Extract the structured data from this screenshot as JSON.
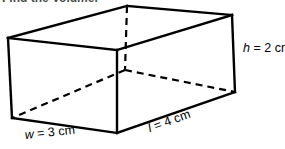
{
  "heading": {
    "text": "Find the Volume."
  },
  "figure": {
    "name": "rectangular-prism",
    "stroke_color": "#000000",
    "background_color": "#ffffff",
    "stroke_width": 2.2,
    "hidden_edge_style": "dashed",
    "vertices": {
      "top_left": [
        8,
        38
      ],
      "top_back": [
        127,
        6
      ],
      "top_right": [
        232,
        15
      ],
      "top_front": [
        117,
        50
      ],
      "bottom_left": [
        12,
        118
      ],
      "bottom_front": [
        117,
        133
      ],
      "bottom_right": [
        235,
        92
      ],
      "bottom_back_hidden": [
        125,
        70
      ]
    }
  },
  "labels": {
    "height": {
      "variable": "h",
      "equals": " = ",
      "value": "2 cm",
      "full": "h = 2 cm"
    },
    "width": {
      "variable": "w",
      "equals": " = ",
      "value": "3 cm",
      "full": "w = 3 cm"
    },
    "length": {
      "variable": "l",
      "equals": " = ",
      "value": "4 cm",
      "full": "l = 4 cm"
    }
  }
}
